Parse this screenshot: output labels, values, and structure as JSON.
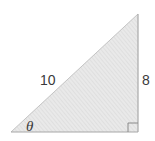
{
  "diagram": {
    "type": "right-triangle",
    "labels": {
      "hypotenuse": "10",
      "opposite_side": "8",
      "angle": "θ"
    },
    "right_angle_marker": true,
    "colors": {
      "fill": "#e6e6e6",
      "hatch": "#d2d2d2",
      "stroke": "#a8a8a8",
      "text": "#3a3a3a"
    }
  }
}
